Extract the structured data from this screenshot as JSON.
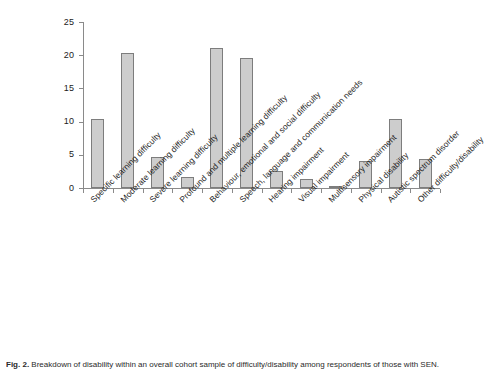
{
  "figure": {
    "caption_label": "Fig. 2.",
    "caption_text": "Breakdown of disability within an overall cohort sample of difficulty/disability among respondents of those with SEN."
  },
  "chart_data": {
    "type": "bar",
    "title": "",
    "xlabel": "",
    "ylabel": "",
    "ylim": [
      0,
      25
    ],
    "yticks": [
      0,
      5,
      10,
      15,
      20,
      25
    ],
    "ytick_labels": [
      "0",
      "5",
      "10",
      "15",
      "20",
      "25"
    ],
    "grid": false,
    "legend": "none",
    "bar_color": "#cdcdcd",
    "bar_edge_color": "#7d7d7d",
    "axis_color": "#8a8a8a",
    "categories": [
      "Specific learning difficulty",
      "Moderate learning difficulty",
      "Severe learning difficulty",
      "Profound and multiple learning difficulty",
      "Behaviour, emotional and social difficulty",
      "Speech, language and communication needs",
      "Hearing impairment",
      "Visual impairment",
      "Multisensory impairment",
      "Physical disability",
      "Autistic spectrum disorder",
      "Other difficulty/disability"
    ],
    "values": [
      10.4,
      20.4,
      4.6,
      1.6,
      21.1,
      19.6,
      2.5,
      1.4,
      0.2,
      4.0,
      10.4,
      4.3
    ]
  }
}
